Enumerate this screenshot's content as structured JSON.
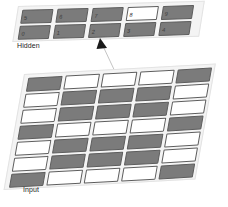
{
  "figure": {
    "type": "neural-network-layer-diagram",
    "background_color": "#ffffff",
    "active_cell_color": "#ffffff",
    "inactive_cell_color": "#7b7b7b",
    "cell_border_color": "#5d5d5d",
    "panel_color": "#f4f4f4"
  },
  "hidden_layer": {
    "label": "Hidden",
    "rows": [
      {
        "row_index": 0,
        "cells": [
          {
            "label": "5",
            "state": "off"
          },
          {
            "label": "6",
            "state": "off"
          },
          {
            "label": "7",
            "state": "off"
          },
          {
            "label": "8",
            "state": "on"
          },
          {
            "label": "9",
            "state": "off"
          }
        ]
      },
      {
        "row_index": 1,
        "cells": [
          {
            "label": "0",
            "state": "off"
          },
          {
            "label": "1",
            "state": "off"
          },
          {
            "label": "2",
            "state": "off"
          },
          {
            "label": "3",
            "state": "off"
          },
          {
            "label": "4",
            "state": "off"
          }
        ]
      }
    ]
  },
  "connector": {
    "name": "arrow-input-to-hidden",
    "points_to": "hidden unit 2",
    "arrowhead": "filled-triangle",
    "line_color": "#bdbdbd",
    "arrow_color": "#1a1a1a"
  },
  "input_layer": {
    "label": "Input",
    "rows": 7,
    "columns": 5,
    "cells": [
      [
        "off",
        "on",
        "on",
        "on",
        "off"
      ],
      [
        "on",
        "off",
        "off",
        "off",
        "on"
      ],
      [
        "on",
        "off",
        "off",
        "off",
        "on"
      ],
      [
        "off",
        "on",
        "on",
        "on",
        "off"
      ],
      [
        "on",
        "off",
        "off",
        "off",
        "on"
      ],
      [
        "on",
        "off",
        "off",
        "off",
        "on"
      ],
      [
        "off",
        "on",
        "on",
        "on",
        "off"
      ]
    ]
  }
}
